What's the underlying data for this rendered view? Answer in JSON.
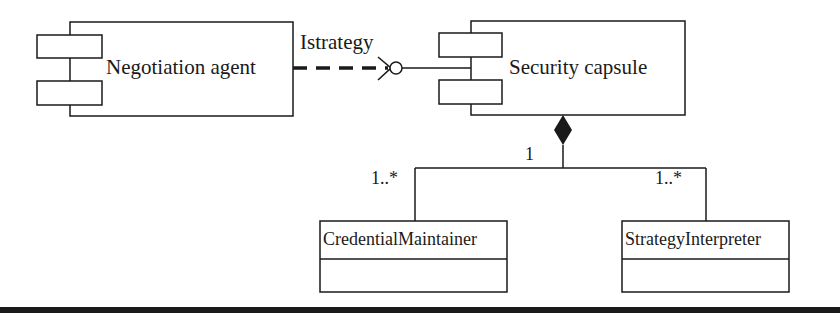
{
  "diagram": {
    "type": "UML component/class diagram",
    "components": [
      {
        "id": "negotiation_agent",
        "label": "Negotiation agent"
      },
      {
        "id": "security_capsule",
        "label": "Security capsule"
      }
    ],
    "interface": {
      "label": "Istrategy",
      "from": "negotiation_agent",
      "to": "security_capsule",
      "style": "dashed dependency to lollipop"
    },
    "composition": {
      "owner": "security_capsule",
      "owner_multiplicity": "1",
      "parts": [
        {
          "id": "credential_maintainer",
          "label": "CredentialMaintainer",
          "multiplicity": "1..*"
        },
        {
          "id": "strategy_interpreter",
          "label": "StrategyInterpreter",
          "multiplicity": "1..*"
        }
      ]
    },
    "colors": {
      "stroke": "#1a1a1a",
      "background": "#ffffff",
      "bottom_bar": "#1a1a1a"
    }
  }
}
